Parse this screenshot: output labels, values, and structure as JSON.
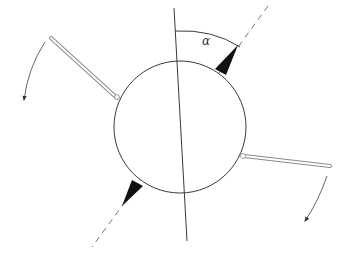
{
  "diagram": {
    "type": "rotating-body-schematic",
    "angle_label": "α",
    "colors": {
      "stroke": "#3a3a3a",
      "wedge_fill": "#111111",
      "dash": "#777777",
      "rod": "#8a8a8a",
      "background": "#ffffff"
    },
    "elements": {
      "circle": {
        "cx": 180,
        "cy": 127,
        "r": 66
      },
      "vertical_axis": {
        "x1": 174,
        "y1": 8,
        "x2": 187,
        "y2": 241
      },
      "dashed_axis": {
        "x1": 268,
        "y1": 6,
        "x2": 92,
        "y2": 247
      },
      "upper_wedge": {
        "tip": [
          238,
          45
        ],
        "base": [
          [
            215,
            69
          ],
          [
            226,
            75
          ]
        ]
      },
      "lower_wedge": {
        "tip": [
          122,
          206
        ],
        "base": [
          [
            132,
            180
          ],
          [
            143,
            186
          ]
        ]
      },
      "left_rod": {
        "from": [
          52,
          36
        ],
        "to": [
          118,
          96
        ]
      },
      "right_rod": {
        "from": [
          243,
          156
        ],
        "to": [
          330,
          166
        ]
      },
      "left_arrow": {
        "start": [
          45,
          42
        ],
        "end": [
          24,
          100
        ]
      },
      "right_arrow": {
        "start": [
          327,
          176
        ],
        "end": [
          305,
          221
        ]
      },
      "angle_arc": {
        "start": [
          175,
          31
        ],
        "end": [
          240,
          47
        ]
      }
    }
  }
}
